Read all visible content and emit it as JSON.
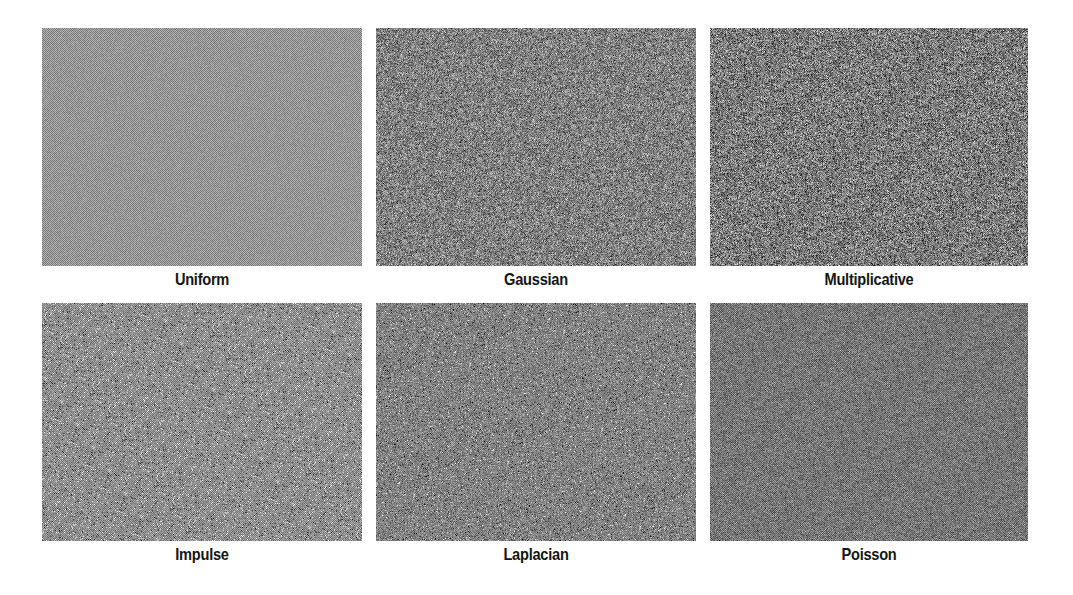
{
  "figure": {
    "panels": [
      {
        "label": "Uniform",
        "noise": {
          "type": "uniform",
          "mean": 150,
          "spread": 22,
          "checker": 28
        }
      },
      {
        "label": "Gaussian",
        "noise": {
          "type": "gaussian",
          "mean": 128,
          "spread": 62,
          "checker": 10
        }
      },
      {
        "label": "Multiplicative",
        "noise": {
          "type": "multiplicative",
          "mean": 122,
          "spread": 68,
          "checker": 10
        }
      },
      {
        "label": "Impulse",
        "noise": {
          "type": "impulse",
          "mean": 142,
          "spread": 30,
          "checker": 22
        }
      },
      {
        "label": "Laplacian",
        "noise": {
          "type": "laplacian",
          "mean": 130,
          "spread": 52,
          "checker": 12
        }
      },
      {
        "label": "Poisson",
        "noise": {
          "type": "poisson",
          "mean": 118,
          "spread": 34,
          "checker": 20
        }
      }
    ],
    "colors": {
      "background": "#ffffff",
      "label_text": "#151515"
    }
  }
}
